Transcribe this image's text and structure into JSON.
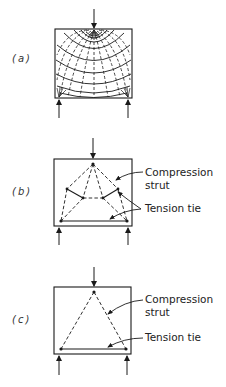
{
  "figure": {
    "panels": [
      {
        "id": "a",
        "label": "(a)",
        "description": "Stress trajectories in a deep member under a concentrated top load and two support reactions"
      },
      {
        "id": "b",
        "label": "(b)",
        "description": "Refined strut-and-tie model",
        "callouts": {
          "compression": [
            "Compression",
            "strut"
          ],
          "tension": "Tension tie"
        }
      },
      {
        "id": "c",
        "label": "(c)",
        "description": "Simple triangular strut-and-tie model",
        "callouts": {
          "compression": [
            "Compression",
            "strut"
          ],
          "tension": "Tension tie"
        }
      }
    ],
    "colors": {
      "line": "#1a1a1a",
      "background": "#ffffff"
    }
  }
}
